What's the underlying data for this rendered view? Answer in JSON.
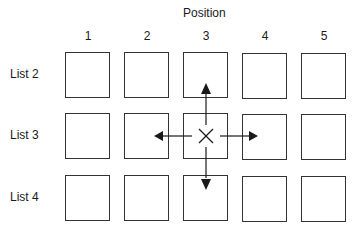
{
  "diagram": {
    "title": "Position",
    "columns": [
      "1",
      "2",
      "3",
      "4",
      "5"
    ],
    "rows": [
      "List 2",
      "List 3",
      "List 4"
    ],
    "center_marker": {
      "row": "List 3",
      "column": "3",
      "symbol": "×"
    },
    "arrows": [
      "up",
      "left",
      "right",
      "down"
    ],
    "colors": {
      "stroke": "#333333",
      "background": "#ffffff"
    }
  }
}
